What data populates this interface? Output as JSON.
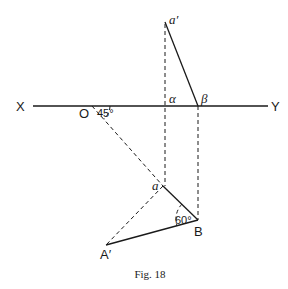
{
  "figure": {
    "caption": "Fig. 18",
    "labels": {
      "X": "X",
      "Y": "Y",
      "O": "O",
      "a_prime": "a′",
      "alpha": "α",
      "beta": "β",
      "a": "a",
      "B": "B",
      "A_prime": "A′",
      "angle_45": "45°",
      "angle_60": "60°"
    },
    "points": {
      "X_end": [
        33,
        106
      ],
      "Y_end": [
        268,
        106
      ],
      "O": [
        92,
        106
      ],
      "a_prime": [
        165,
        22
      ],
      "alpha": [
        166,
        106
      ],
      "beta": [
        198,
        106
      ],
      "a": [
        163,
        186
      ],
      "B": [
        198,
        220
      ],
      "A_prime": [
        106,
        245
      ]
    },
    "angles": {
      "at_O": "45°",
      "at_B": "60°"
    }
  }
}
